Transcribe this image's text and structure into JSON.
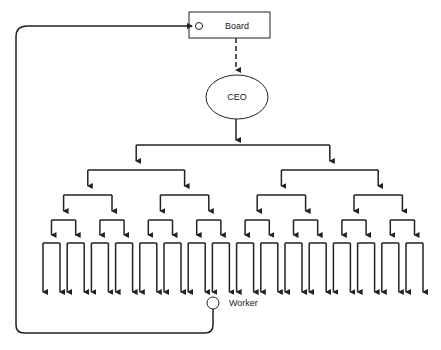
{
  "diagram": {
    "type": "org-hierarchy",
    "board": {
      "label": "Board"
    },
    "ceo": {
      "label": "CEO"
    },
    "worker": {
      "label": "Worker"
    },
    "levels": {
      "root_children": 2,
      "branching": 2,
      "bracket_levels": 5,
      "leaf_count": 32
    },
    "colors": {
      "line": "#222222",
      "background": "#ffffff"
    }
  }
}
